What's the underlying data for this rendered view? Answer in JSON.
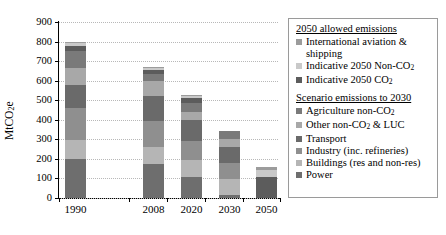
{
  "chart_data": {
    "type": "bar",
    "subtype": "stacked-bar",
    "title": "",
    "xlabel": "",
    "ylabel": "MtCO2e",
    "ylabel_display": "MtCO₂e",
    "categories": [
      "1990",
      "2008",
      "2020",
      "2030",
      "2050"
    ],
    "ylim": [
      0,
      900
    ],
    "yticks": [
      0,
      100,
      200,
      300,
      400,
      500,
      600,
      700,
      800,
      900
    ],
    "grid": true,
    "grid_style": "dotted-horizontal",
    "legend_position": "right",
    "series": [
      {
        "name": "Power",
        "group": "Scenario emissions to 2030",
        "color": "#6e6e6e",
        "values": [
          200,
          172,
          108,
          15,
          0
        ]
      },
      {
        "name": "Buildings (res and non-res)",
        "group": "Scenario emissions to 2030",
        "color": "#b5b5b5",
        "values": [
          95,
          90,
          85,
          80,
          0
        ]
      },
      {
        "name": "Industry (inc. refineries)",
        "group": "Scenario emissions to 2030",
        "color": "#8f8f8f",
        "values": [
          165,
          130,
          100,
          85,
          0
        ]
      },
      {
        "name": "Transport",
        "group": "Scenario emissions to 2030",
        "color": "#6a6a6a",
        "values": [
          120,
          130,
          105,
          80,
          0
        ]
      },
      {
        "name": "Other non-CO2 & LUC",
        "group": "Scenario emissions to 2030",
        "color": "#a8a8a8",
        "values": [
          85,
          75,
          40,
          40,
          0
        ]
      },
      {
        "name": "Agriculture non-CO2",
        "group": "Scenario emissions to 2030",
        "color": "#7a7a7a",
        "values": [
          85,
          35,
          50,
          43,
          0
        ]
      },
      {
        "name": "Indicative 2050 CO2",
        "group": "2050 allowed emissions",
        "color": "#5c5c5c",
        "values": [
          28,
          22,
          24,
          0,
          105
        ]
      },
      {
        "name": "Indicative 2050 Non-CO2",
        "group": "2050 allowed emissions",
        "color": "#c9c9c9",
        "values": [
          14,
          10,
          10,
          0,
          40
        ]
      },
      {
        "name": "International aviation & shipping",
        "group": "2050 allowed emissions",
        "color": "#9c9c9c",
        "values": [
          8,
          6,
          5,
          0,
          13
        ]
      }
    ],
    "totals": [
      800,
      670,
      527,
      343,
      158
    ]
  },
  "axes": {
    "y_tick_labels": [
      "900",
      "800",
      "700",
      "600",
      "500",
      "400",
      "300",
      "200",
      "100",
      "0"
    ],
    "y_axis_title": "MtCO₂e",
    "x_tick_labels": [
      "1990",
      "2008",
      "2020",
      "2030",
      "2050"
    ]
  },
  "legend": {
    "groups": [
      {
        "title": "2050 allowed emissions",
        "items": [
          {
            "label": "International aviation &",
            "label_line2": "shipping",
            "color": "#9c9c9c"
          },
          {
            "label": "Indicative 2050 Non-CO",
            "sub": "2",
            "color": "#c9c9c9"
          },
          {
            "label": "Indicative 2050 CO",
            "sub": "2",
            "color": "#5c5c5c"
          }
        ]
      },
      {
        "title": "Scenario emissions to 2030",
        "items": [
          {
            "label": "Agriculture non-CO",
            "sub": "2",
            "color": "#7a7a7a"
          },
          {
            "label": "Other non-CO",
            "sub": "2",
            "label_tail": " & LUC",
            "color": "#a8a8a8"
          },
          {
            "label": "Transport",
            "color": "#6a6a6a"
          },
          {
            "label": "Industry (inc. refineries)",
            "color": "#8f8f8f"
          },
          {
            "label": "Buildings (res and non-res)",
            "color": "#b5b5b5"
          },
          {
            "label": "Power",
            "color": "#6e6e6e"
          }
        ]
      }
    ]
  }
}
